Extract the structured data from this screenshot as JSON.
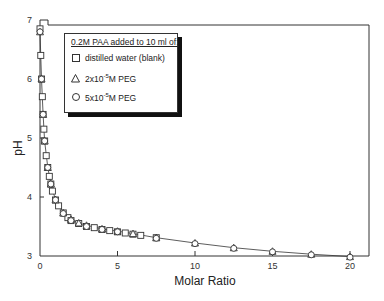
{
  "chart_data": {
    "type": "scatter",
    "title": "",
    "xlabel": "Molar Ratio",
    "ylabel": "pH",
    "xlim": [
      0,
      21
    ],
    "ylim": [
      3,
      7
    ],
    "x_ticks": [
      0,
      5,
      10,
      15,
      20
    ],
    "y_ticks": [
      3,
      4,
      5,
      6,
      7
    ],
    "grid": false,
    "legend_position": "upper-left inset",
    "legend_title": "0.2M PAA added to 10 ml of:",
    "series": [
      {
        "name": "distilled water (blank)",
        "marker": "square",
        "x": [
          0,
          0.05,
          0.1,
          0.15,
          0.2,
          0.25,
          0.3,
          0.4,
          0.5,
          0.6,
          0.7,
          0.8,
          1.0,
          1.2,
          1.5,
          1.8,
          2.0,
          2.5,
          3.0,
          3.5,
          4.0,
          4.5,
          5.0,
          5.5,
          6.0,
          6.5,
          7.5
        ],
        "y": [
          6.85,
          6.4,
          6.0,
          5.7,
          5.4,
          5.15,
          4.95,
          4.7,
          4.5,
          4.35,
          4.22,
          4.1,
          3.95,
          3.85,
          3.73,
          3.65,
          3.6,
          3.55,
          3.5,
          3.48,
          3.45,
          3.43,
          3.41,
          3.39,
          3.37,
          3.35,
          3.31
        ]
      },
      {
        "name": "2x10^-5 M PEG",
        "marker": "triangle",
        "x": [
          0,
          0.1,
          0.2,
          0.3,
          0.5,
          0.7,
          1.0,
          1.5,
          2.0,
          2.5,
          3.0,
          4.0,
          5.0,
          6.0,
          7.5,
          10,
          12.5,
          15,
          17.5,
          20
        ],
        "y": [
          6.8,
          6.0,
          5.4,
          4.95,
          4.5,
          4.22,
          3.95,
          3.73,
          3.62,
          3.56,
          3.52,
          3.46,
          3.42,
          3.38,
          3.31,
          3.22,
          3.14,
          3.08,
          3.03,
          2.99
        ]
      },
      {
        "name": "5x10^-5 M PEG",
        "marker": "circle",
        "x": [
          0,
          0.1,
          0.2,
          0.3,
          0.5,
          0.7,
          1.0,
          1.5,
          2.0,
          3.0,
          4.0,
          5.0,
          7.5,
          10,
          12.5,
          15,
          17.5,
          20
        ],
        "y": [
          6.8,
          6.0,
          5.4,
          4.95,
          4.5,
          4.22,
          3.95,
          3.72,
          3.6,
          3.5,
          3.45,
          3.41,
          3.3,
          3.21,
          3.13,
          3.07,
          3.02,
          2.98
        ]
      }
    ]
  },
  "legend": {
    "title": "0.2M PAA added to 10 ml of:",
    "items": [
      {
        "symbol": "square",
        "label": "distilled water (blank)"
      },
      {
        "symbol": "triangle",
        "prefix": "2x10",
        "sup": "-5",
        "suffix": "M PEG"
      },
      {
        "symbol": "circle",
        "prefix": "5x10",
        "sup": "-5",
        "suffix": "M PEG"
      }
    ]
  },
  "axes": {
    "x_title": "Molar Ratio",
    "y_title": "pH",
    "x_tick_labels": [
      "0",
      "5",
      "10",
      "15",
      "20"
    ],
    "y_tick_labels": [
      "3",
      "4",
      "5",
      "6",
      "7"
    ]
  }
}
